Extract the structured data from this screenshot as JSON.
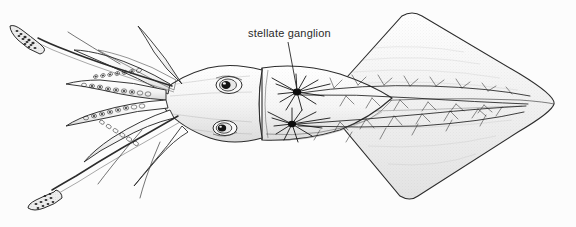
{
  "figure": {
    "style": "pen-and-ink scientific illustration",
    "background_color": "#fcfcfc",
    "ink_color": "#1a1a1a",
    "width": 576,
    "height": 227
  },
  "annotations": [
    {
      "id": "stellate-ganglion",
      "label": "stellate ganglion",
      "text_x": 248,
      "text_y": 28,
      "leader_from_x": 288,
      "leader_from_y": 42,
      "leader_to_x": 297,
      "leader_to_y": 92
    }
  ],
  "anatomy": {
    "tentacles_label": "tentacle",
    "arms_label": "arm",
    "eye_label": "eye",
    "mantle_label": "mantle",
    "fin_label": "fin",
    "ganglion_label": "stellate ganglion",
    "nerve_label": "mantle nerve"
  },
  "structures": {
    "eyes": 2,
    "ganglia": 2,
    "long_tentacles": 2,
    "arms": 8
  }
}
